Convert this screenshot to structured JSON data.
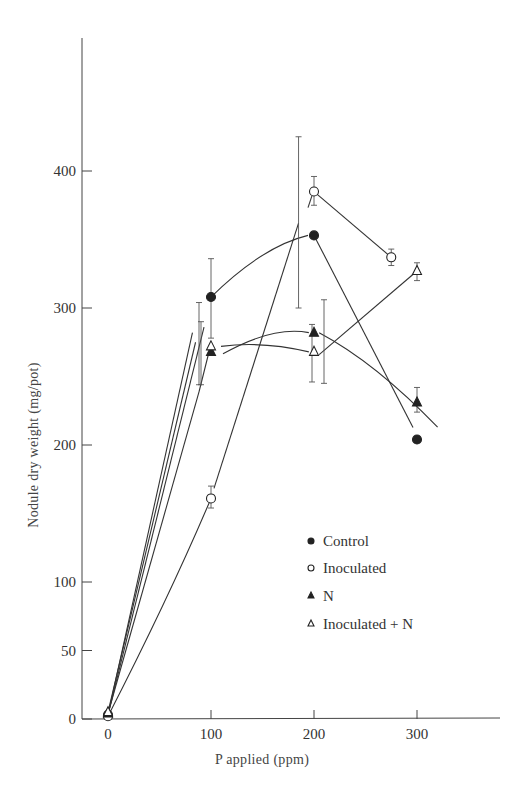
{
  "chart_data": {
    "type": "line",
    "title": "",
    "xlabel": "P applied (ppm)",
    "ylabel": "Nodule dry weight (mg/pot)",
    "xlim": [
      0,
      370
    ],
    "ylim": [
      0,
      500
    ],
    "x_ticks": [
      0,
      100,
      200,
      300
    ],
    "y_ticks": [
      0,
      50,
      100,
      200,
      300,
      400
    ],
    "grid": false,
    "legend_position": "lower right (inside)",
    "series": [
      {
        "name": "Control",
        "marker": "filled-circle",
        "x": [
          0,
          100,
          200,
          300
        ],
        "values": [
          3,
          308,
          353,
          204
        ],
        "error_low": [
          null,
          278,
          null,
          202
        ],
        "error_high": [
          null,
          336,
          null,
          206
        ]
      },
      {
        "name": "Inoculated",
        "marker": "open-circle",
        "x": [
          0,
          100,
          200,
          275
        ],
        "values": [
          2,
          161,
          385,
          337
        ],
        "error_low": [
          null,
          154,
          375,
          331
        ],
        "error_high": [
          null,
          170,
          396,
          343
        ]
      },
      {
        "name": "N",
        "marker": "filled-triangle",
        "x": [
          0,
          100,
          200,
          300
        ],
        "values": [
          4,
          268,
          282,
          231
        ],
        "error_low": [
          null,
          244,
          246,
          224
        ],
        "error_high": [
          null,
          304,
          288,
          242
        ]
      },
      {
        "name": "Inoculated + N",
        "marker": "open-triangle",
        "x": [
          0,
          100,
          200,
          300
        ],
        "values": [
          5,
          272,
          268,
          327
        ],
        "error_low": [
          null,
          244,
          245,
          320
        ],
        "error_high": [
          null,
          290,
          306,
          333
        ]
      }
    ],
    "annotations": [
      {
        "note": "large error bar near x=185",
        "low": 300,
        "high": 425
      }
    ]
  },
  "legend": {
    "items": [
      {
        "label": "Control",
        "marker": "filled-circle"
      },
      {
        "label": "Inoculated",
        "marker": "open-circle"
      },
      {
        "label": "N",
        "marker": "filled-triangle"
      },
      {
        "label": "Inoculated + N",
        "marker": "open-triangle"
      }
    ]
  },
  "axes": {
    "x_title": "P applied (ppm)",
    "y_title": "Nodule dry weight (mg/pot)",
    "x_tick_labels": [
      "0",
      "100",
      "200",
      "300"
    ],
    "y_tick_labels": [
      "0",
      "50",
      "100",
      "200",
      "300",
      "400"
    ]
  }
}
